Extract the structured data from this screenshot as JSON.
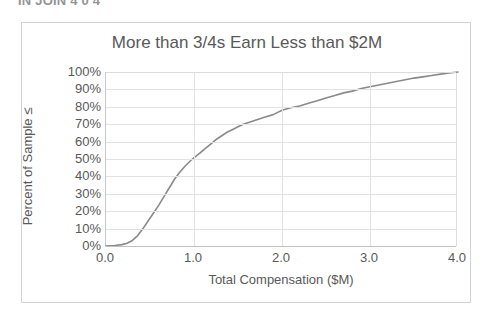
{
  "page": {
    "clipped_header_text": "IN JOIN 4 0 4",
    "background_color": "#ffffff"
  },
  "chart": {
    "frame_border_color": "#d4d4d4",
    "title": "More than 3/4s Earn Less than $2M",
    "title_color": "#595959",
    "line_color": "#8a8a8a",
    "grid_color": "#e2e2e2",
    "axis_color": "#c0c0c0"
  },
  "chart_data": {
    "type": "line",
    "title": "More than 3/4s Earn Less than $2M",
    "xlabel": "Total Compensation ($M)",
    "ylabel": "Percent of Sample ≤",
    "xlim": [
      0.0,
      4.0
    ],
    "ylim": [
      0,
      100
    ],
    "grid": true,
    "legend": "none",
    "xticks": [
      "0.0",
      "1.0",
      "2.0",
      "3.0",
      "4.0"
    ],
    "xtick_values": [
      0.0,
      1.0,
      2.0,
      3.0,
      4.0
    ],
    "yticks": [
      "0%",
      "10%",
      "20%",
      "30%",
      "40%",
      "50%",
      "60%",
      "70%",
      "80%",
      "90%",
      "100%"
    ],
    "ytick_values": [
      0,
      10,
      20,
      30,
      40,
      50,
      60,
      70,
      80,
      90,
      100
    ],
    "series": [
      {
        "name": "Cumulative percent of sample",
        "x": [
          0.0,
          0.1,
          0.18,
          0.24,
          0.3,
          0.36,
          0.42,
          0.48,
          0.54,
          0.6,
          0.66,
          0.72,
          0.78,
          0.84,
          0.9,
          0.96,
          1.02,
          1.08,
          1.14,
          1.2,
          1.26,
          1.32,
          1.38,
          1.44,
          1.5,
          1.56,
          1.62,
          1.68,
          1.74,
          1.8,
          1.9,
          2.0,
          2.1,
          2.2,
          2.3,
          2.4,
          2.5,
          2.6,
          2.7,
          2.8,
          2.9,
          3.0,
          3.1,
          3.2,
          3.3,
          3.4,
          3.5,
          3.6,
          3.7,
          3.8,
          3.9,
          4.0
        ],
        "y": [
          0.0,
          0.3,
          0.8,
          1.6,
          3.2,
          6.0,
          10.0,
          14.5,
          19.0,
          23.5,
          28.5,
          33.5,
          38.5,
          42.5,
          46.0,
          49.0,
          51.5,
          54.0,
          56.5,
          59.0,
          61.5,
          63.5,
          65.5,
          67.0,
          68.5,
          70.0,
          71.0,
          72.0,
          73.0,
          74.0,
          75.5,
          78.0,
          79.5,
          80.5,
          82.0,
          83.5,
          85.0,
          86.5,
          88.0,
          89.0,
          90.5,
          91.5,
          92.5,
          93.5,
          94.5,
          95.5,
          96.5,
          97.2,
          98.0,
          98.8,
          99.4,
          100.0
        ]
      }
    ]
  }
}
